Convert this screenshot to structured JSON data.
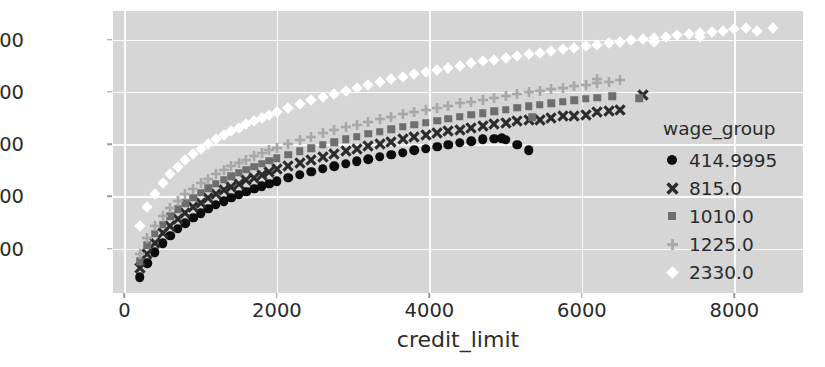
{
  "chart_data": {
    "type": "scatter",
    "title": "",
    "xlabel": "credit_limit",
    "ylabel": "spend",
    "xlim": [
      -150,
      8900
    ],
    "ylim": [
      1150,
      6550
    ],
    "xticks": [
      0,
      2000,
      4000,
      6000,
      8000
    ],
    "yticks": [
      2000,
      3000,
      4000,
      5000,
      6000
    ],
    "xtick_labels": [
      "0",
      "2000",
      "4000",
      "6000",
      "8000"
    ],
    "ytick_labels": [
      "2000",
      "3000",
      "4000",
      "5000",
      "6000"
    ],
    "grid": true,
    "grid_color": "#fbfbfb",
    "plot_background": "#d6d6d6",
    "figure_background": "#ffffff",
    "legend": {
      "title": "wage_group",
      "position": "right",
      "entries": [
        {
          "label": "414.9995",
          "marker": "circle",
          "color": "#0d0d0d",
          "size": 9
        },
        {
          "label": "815.0",
          "marker": "x",
          "color": "#2b2b2b",
          "size": 9
        },
        {
          "label": "1010.0",
          "marker": "square",
          "color": "#6e6e6e",
          "size": 8
        },
        {
          "label": "1225.0",
          "marker": "plus",
          "color": "#a8a8a8",
          "size": 9
        },
        {
          "label": "2330.0",
          "marker": "diamond",
          "color": "#ffffff",
          "size": 9
        }
      ]
    },
    "series": [
      {
        "name": "414.9995",
        "marker": "circle",
        "color": "#0d0d0d",
        "points": [
          [
            200,
            1450
          ],
          [
            300,
            1720
          ],
          [
            400,
            1930
          ],
          [
            500,
            2100
          ],
          [
            600,
            2250
          ],
          [
            700,
            2380
          ],
          [
            800,
            2490
          ],
          [
            900,
            2590
          ],
          [
            1000,
            2680
          ],
          [
            1100,
            2760
          ],
          [
            1200,
            2840
          ],
          [
            1300,
            2910
          ],
          [
            1400,
            2975
          ],
          [
            1500,
            3035
          ],
          [
            1600,
            3090
          ],
          [
            1700,
            3145
          ],
          [
            1800,
            3195
          ],
          [
            1900,
            3245
          ],
          [
            2000,
            3290
          ],
          [
            2150,
            3355
          ],
          [
            2300,
            3415
          ],
          [
            2450,
            3470
          ],
          [
            2600,
            3525
          ],
          [
            2750,
            3575
          ],
          [
            2900,
            3625
          ],
          [
            3050,
            3670
          ],
          [
            3200,
            3715
          ],
          [
            3350,
            3755
          ],
          [
            3500,
            3800
          ],
          [
            3650,
            3840
          ],
          [
            3800,
            3880
          ],
          [
            3950,
            3915
          ],
          [
            4100,
            3955
          ],
          [
            4250,
            3990
          ],
          [
            4400,
            4025
          ],
          [
            4550,
            4060
          ],
          [
            4700,
            4090
          ],
          [
            4850,
            4105
          ],
          [
            5000,
            4080
          ],
          [
            5150,
            3990
          ],
          [
            5300,
            3880
          ],
          [
            4950,
            4115
          ]
        ]
      },
      {
        "name": "815.0",
        "marker": "x",
        "color": "#2b2b2b",
        "points": [
          [
            200,
            1620
          ],
          [
            300,
            1900
          ],
          [
            400,
            2110
          ],
          [
            500,
            2290
          ],
          [
            600,
            2440
          ],
          [
            700,
            2570
          ],
          [
            800,
            2685
          ],
          [
            900,
            2790
          ],
          [
            1000,
            2880
          ],
          [
            1100,
            2965
          ],
          [
            1200,
            3045
          ],
          [
            1300,
            3115
          ],
          [
            1400,
            3185
          ],
          [
            1500,
            3245
          ],
          [
            1600,
            3305
          ],
          [
            1700,
            3360
          ],
          [
            1800,
            3415
          ],
          [
            1900,
            3465
          ],
          [
            2000,
            3515
          ],
          [
            2150,
            3580
          ],
          [
            2300,
            3645
          ],
          [
            2450,
            3705
          ],
          [
            2600,
            3760
          ],
          [
            2750,
            3815
          ],
          [
            2900,
            3865
          ],
          [
            3050,
            3915
          ],
          [
            3200,
            3960
          ],
          [
            3350,
            4005
          ],
          [
            3500,
            4050
          ],
          [
            3650,
            4090
          ],
          [
            3800,
            4130
          ],
          [
            3950,
            4170
          ],
          [
            4100,
            4210
          ],
          [
            4250,
            4245
          ],
          [
            4400,
            4280
          ],
          [
            4550,
            4315
          ],
          [
            4700,
            4350
          ],
          [
            4850,
            4380
          ],
          [
            5000,
            4410
          ],
          [
            5150,
            4440
          ],
          [
            5300,
            4470
          ],
          [
            5450,
            4470
          ],
          [
            5600,
            4500
          ],
          [
            5750,
            4530
          ],
          [
            5900,
            4545
          ],
          [
            6050,
            4560
          ],
          [
            6200,
            4610
          ],
          [
            6350,
            4640
          ],
          [
            6500,
            4660
          ],
          [
            6800,
            4950
          ]
        ]
      },
      {
        "name": "1010.0",
        "marker": "square",
        "color": "#6e6e6e",
        "points": [
          [
            200,
            1760
          ],
          [
            300,
            2060
          ],
          [
            400,
            2280
          ],
          [
            500,
            2460
          ],
          [
            600,
            2620
          ],
          [
            700,
            2750
          ],
          [
            800,
            2870
          ],
          [
            900,
            2975
          ],
          [
            1000,
            3070
          ],
          [
            1100,
            3160
          ],
          [
            1200,
            3240
          ],
          [
            1300,
            3315
          ],
          [
            1400,
            3385
          ],
          [
            1500,
            3450
          ],
          [
            1600,
            3510
          ],
          [
            1700,
            3570
          ],
          [
            1800,
            3625
          ],
          [
            1900,
            3680
          ],
          [
            2000,
            3730
          ],
          [
            2150,
            3800
          ],
          [
            2300,
            3865
          ],
          [
            2450,
            3925
          ],
          [
            2600,
            3985
          ],
          [
            2750,
            4040
          ],
          [
            2900,
            4095
          ],
          [
            3050,
            4145
          ],
          [
            3200,
            4195
          ],
          [
            3350,
            4240
          ],
          [
            3500,
            4285
          ],
          [
            3650,
            4330
          ],
          [
            3800,
            4370
          ],
          [
            3950,
            4410
          ],
          [
            4100,
            4450
          ],
          [
            4250,
            4490
          ],
          [
            4400,
            4525
          ],
          [
            4550,
            4560
          ],
          [
            4700,
            4595
          ],
          [
            4850,
            4630
          ],
          [
            5000,
            4660
          ],
          [
            5150,
            4695
          ],
          [
            5300,
            4725
          ],
          [
            5450,
            4755
          ],
          [
            5600,
            4785
          ],
          [
            5750,
            4810
          ],
          [
            5900,
            4840
          ],
          [
            6050,
            4865
          ],
          [
            6200,
            4890
          ],
          [
            6400,
            4920
          ],
          [
            6750,
            4880
          ],
          [
            5350,
            4520
          ]
        ]
      },
      {
        "name": "1225.0",
        "marker": "plus",
        "color": "#a8a8a8",
        "points": [
          [
            200,
            1890
          ],
          [
            300,
            2200
          ],
          [
            400,
            2430
          ],
          [
            500,
            2620
          ],
          [
            600,
            2780
          ],
          [
            700,
            2915
          ],
          [
            800,
            3040
          ],
          [
            900,
            3150
          ],
          [
            1000,
            3250
          ],
          [
            1100,
            3340
          ],
          [
            1200,
            3425
          ],
          [
            1300,
            3500
          ],
          [
            1400,
            3575
          ],
          [
            1500,
            3640
          ],
          [
            1600,
            3705
          ],
          [
            1700,
            3765
          ],
          [
            1800,
            3825
          ],
          [
            1900,
            3880
          ],
          [
            2000,
            3935
          ],
          [
            2150,
            4010
          ],
          [
            2300,
            4080
          ],
          [
            2450,
            4145
          ],
          [
            2600,
            4205
          ],
          [
            2750,
            4265
          ],
          [
            2900,
            4320
          ],
          [
            3050,
            4375
          ],
          [
            3200,
            4425
          ],
          [
            3350,
            4475
          ],
          [
            3500,
            4525
          ],
          [
            3650,
            4570
          ],
          [
            3800,
            4615
          ],
          [
            3950,
            4655
          ],
          [
            4100,
            4700
          ],
          [
            4250,
            4740
          ],
          [
            4400,
            4780
          ],
          [
            4550,
            4815
          ],
          [
            4700,
            4855
          ],
          [
            4850,
            4890
          ],
          [
            5000,
            4925
          ],
          [
            5150,
            4960
          ],
          [
            5300,
            4990
          ],
          [
            5450,
            5020
          ],
          [
            5600,
            5055
          ],
          [
            5750,
            5085
          ],
          [
            5900,
            5115
          ],
          [
            6050,
            5140
          ],
          [
            6200,
            5170
          ],
          [
            6350,
            5200
          ],
          [
            6500,
            5225
          ],
          [
            6200,
            5250
          ]
        ]
      },
      {
        "name": "2330.0",
        "marker": "diamond",
        "color": "#ffffff",
        "points": [
          [
            200,
            2430
          ],
          [
            300,
            2800
          ],
          [
            400,
            3050
          ],
          [
            500,
            3250
          ],
          [
            600,
            3420
          ],
          [
            700,
            3560
          ],
          [
            800,
            3690
          ],
          [
            900,
            3805
          ],
          [
            1000,
            3910
          ],
          [
            1100,
            4000
          ],
          [
            1200,
            4090
          ],
          [
            1300,
            4170
          ],
          [
            1400,
            4245
          ],
          [
            1500,
            4315
          ],
          [
            1600,
            4380
          ],
          [
            1700,
            4445
          ],
          [
            1800,
            4505
          ],
          [
            1900,
            4560
          ],
          [
            2000,
            4615
          ],
          [
            2150,
            4695
          ],
          [
            2300,
            4770
          ],
          [
            2450,
            4840
          ],
          [
            2600,
            4905
          ],
          [
            2750,
            4970
          ],
          [
            2900,
            5025
          ],
          [
            3050,
            5085
          ],
          [
            3200,
            5140
          ],
          [
            3350,
            5190
          ],
          [
            3500,
            5240
          ],
          [
            3650,
            5290
          ],
          [
            3800,
            5335
          ],
          [
            3950,
            5380
          ],
          [
            4100,
            5425
          ],
          [
            4250,
            5465
          ],
          [
            4400,
            5505
          ],
          [
            4550,
            5545
          ],
          [
            4700,
            5585
          ],
          [
            4850,
            5620
          ],
          [
            5000,
            5655
          ],
          [
            5150,
            5690
          ],
          [
            5300,
            5725
          ],
          [
            5450,
            5755
          ],
          [
            5600,
            5790
          ],
          [
            5750,
            5820
          ],
          [
            5900,
            5850
          ],
          [
            6050,
            5880
          ],
          [
            6200,
            5905
          ],
          [
            6350,
            5935
          ],
          [
            6500,
            5960
          ],
          [
            6650,
            5990
          ],
          [
            6800,
            6010
          ],
          [
            6950,
            6040
          ],
          [
            7100,
            6060
          ],
          [
            7250,
            6085
          ],
          [
            7400,
            6105
          ],
          [
            7550,
            6130
          ],
          [
            7700,
            6150
          ],
          [
            7850,
            6170
          ],
          [
            8000,
            6200
          ],
          [
            8150,
            6230
          ],
          [
            8300,
            6160
          ],
          [
            8500,
            6230
          ],
          [
            7550,
            6060
          ],
          [
            6950,
            5960
          ]
        ]
      }
    ]
  }
}
